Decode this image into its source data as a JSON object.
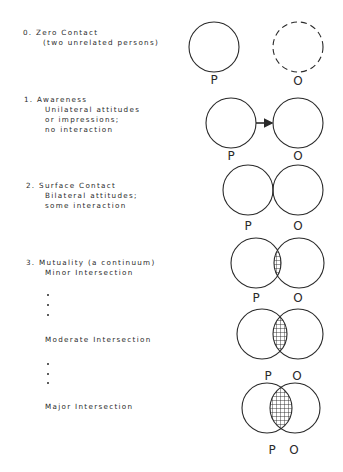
{
  "stages": [
    {
      "heading": "0. Zero Contact",
      "lines": [
        "(two unrelated persons)"
      ],
      "diagram": "separate circles, O dashed",
      "labels": {
        "p": "P",
        "o": "O"
      }
    },
    {
      "heading": "1. Awareness",
      "lines": [
        "Unilateral attitudes",
        "or impressions;",
        "no interaction"
      ],
      "diagram": "separate circles with arrow P to O",
      "labels": {
        "p": "P",
        "o": "O"
      }
    },
    {
      "heading": "2. Surface Contact",
      "lines": [
        "Bilateral attitudes;",
        "some interaction"
      ],
      "diagram": "touching circles",
      "labels": {
        "p": "P",
        "o": "O"
      }
    },
    {
      "heading": "3. Mutuality (a continuum)",
      "sub": [
        {
          "label": "Minor Intersection",
          "labels": {
            "p": "P",
            "o": "O"
          }
        },
        {
          "label": "Moderate Intersection",
          "labels": {
            "p": "P",
            "o": "O"
          }
        },
        {
          "label": "Major Intersection",
          "labels": {
            "p": "P",
            "o": "O"
          }
        }
      ]
    }
  ],
  "colors": {
    "ink": "#2a2a2a",
    "background": "#ffffff"
  }
}
